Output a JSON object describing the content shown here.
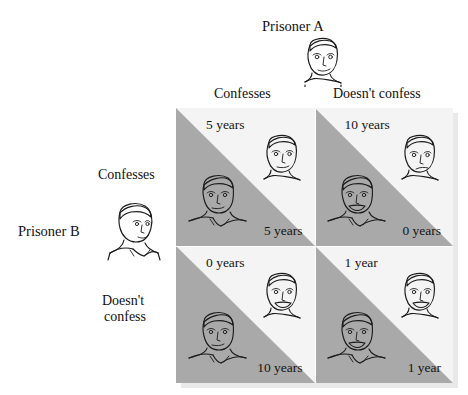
{
  "diagram": {
    "title_a": "Prisoner A",
    "title_b": "Prisoner B",
    "column_headers": [
      "Confesses",
      "Doesn't confess"
    ],
    "row_headers": [
      {
        "line1": "Confesses",
        "line2": ""
      },
      {
        "line1": "Doesn't",
        "line2": "confess"
      }
    ],
    "colors": {
      "upper_triangle": "#f4f4f4",
      "lower_triangle": "#a9a9a9",
      "shadow": "#e9e9e9",
      "text": "#141414"
    },
    "cells": [
      {
        "id": "confess-confess",
        "row": "Confesses",
        "column": "Confesses",
        "payoff_a": "5 years",
        "payoff_b": "5 years",
        "face_a": "man-face-neutral",
        "face_b": "man-face-neutral"
      },
      {
        "id": "confess-notconfess",
        "row": "Confesses",
        "column": "Doesn't confess",
        "payoff_a": "10 years",
        "payoff_b": "0 years",
        "face_a": "man-face-sad",
        "face_b": "man-face-smiling"
      },
      {
        "id": "notconfess-confess",
        "row": "Doesn't confess",
        "column": "Confesses",
        "payoff_a": "0 years",
        "payoff_b": "10 years",
        "face_a": "man-face-smiling",
        "face_b": "man-face-neutral"
      },
      {
        "id": "notconfess-notconfess",
        "row": "Doesn't confess",
        "column": "Doesn't confess",
        "payoff_a": "1 year",
        "payoff_b": "1 year",
        "face_a": "man-face-smiling",
        "face_b": "man-face-smiling"
      }
    ]
  }
}
